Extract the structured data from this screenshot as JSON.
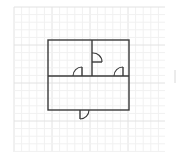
{
  "canvas": {
    "width": 177,
    "height": 161,
    "background": "#ffffff"
  },
  "grid": {
    "x": 14,
    "y": 7,
    "width": 151,
    "height": 145,
    "minor_step": 7.6,
    "major_step": 38,
    "minor_color": "#f1f1f1",
    "major_color": "#e2e2e2"
  },
  "floor_plan": {
    "wall_color": "#3a3a3a",
    "wall_width": 1.4,
    "outer_walls": {
      "x": 48,
      "y": 40,
      "width": 81,
      "height": 70
    },
    "interior_walls": [
      {
        "name": "middle-horizontal-wall",
        "x1": 48,
        "y1": 76,
        "x2": 129,
        "y2": 76
      },
      {
        "name": "upper-vertical-wall",
        "x1": 92,
        "y1": 40,
        "x2": 92,
        "y2": 76
      }
    ],
    "doors": [
      {
        "name": "door-upper-left-room",
        "leaf": [
          82,
          76,
          82,
          67
        ],
        "arc_from": [
          73,
          76
        ],
        "arc_to": [
          82,
          67
        ],
        "radius": 9,
        "sweep": 1
      },
      {
        "name": "door-upper-divider",
        "leaf": [
          92,
          62,
          102,
          62
        ],
        "arc_from": [
          92,
          53
        ],
        "arc_to": [
          102,
          62
        ],
        "radius": 9,
        "sweep": 1
      },
      {
        "name": "door-upper-right-room",
        "leaf": [
          123,
          76,
          123,
          67
        ],
        "arc_from": [
          114,
          76
        ],
        "arc_to": [
          123,
          67
        ],
        "radius": 9,
        "sweep": 1
      },
      {
        "name": "door-entrance",
        "leaf": [
          80,
          110,
          80,
          119
        ],
        "arc_from": [
          80,
          119
        ],
        "arc_to": [
          89,
          110
        ],
        "radius": 9,
        "sweep": 0
      }
    ]
  },
  "edge_mark": {
    "x": 175,
    "y1": 70,
    "y2": 83,
    "color": "#d8d8d8"
  }
}
